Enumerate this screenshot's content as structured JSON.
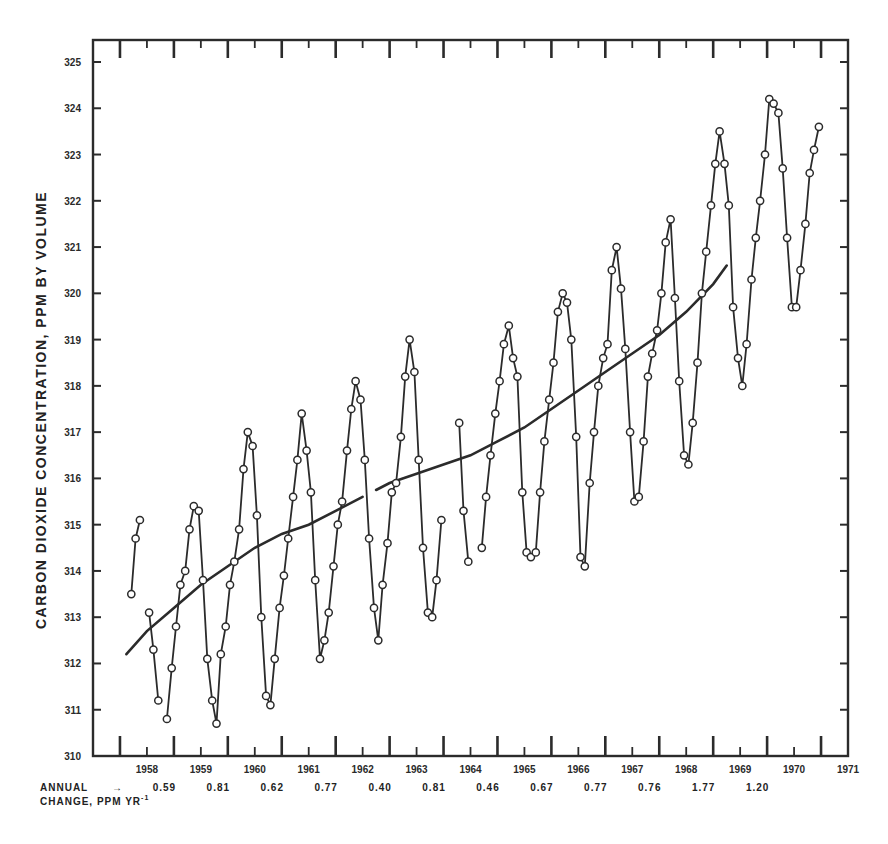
{
  "chart_data": {
    "type": "line",
    "title": "",
    "xlabel": "",
    "ylabel": "CARBON DIOXIDE CONCENTRATION, PPM BY VOLUME",
    "ylim": [
      310,
      325
    ],
    "xlim": [
      1957.5,
      1971.5
    ],
    "y_ticks": [
      "310",
      "311",
      "312",
      "313",
      "314",
      "315",
      "316",
      "317",
      "318",
      "319",
      "320",
      "321",
      "322",
      "323",
      "324",
      "325"
    ],
    "x_tick_labels": [
      "1958",
      "1959",
      "1960",
      "1961",
      "1962",
      "1963",
      "1964",
      "1965",
      "1966",
      "1967",
      "1968",
      "1969",
      "1970",
      "1971"
    ],
    "grid": false,
    "annual_change": {
      "label_line1": "ANNUAL",
      "label_line2": "CHANGE, PPM YR",
      "label_superscript": "-1",
      "arrow": "→",
      "values": [
        "0.59",
        "0.81",
        "0.62",
        "0.77",
        "0.40",
        "0.81",
        "0.46",
        "0.67",
        "0.77",
        "0.76",
        "1.77",
        "1.20"
      ]
    },
    "series": [
      {
        "name": "monthly-mean-co2",
        "marker": "open-circle",
        "segments": [
          [
            [
              1958.21,
              313.5
            ],
            [
              1958.29,
              314.7
            ],
            [
              1958.37,
              315.1
            ]
          ],
          [
            [
              1958.54,
              313.1
            ],
            [
              1958.62,
              312.3
            ],
            [
              1958.71,
              311.2
            ]
          ],
          [
            [
              1958.87,
              310.8
            ],
            [
              1958.96,
              311.9
            ],
            [
              1959.04,
              312.8
            ],
            [
              1959.12,
              313.7
            ],
            [
              1959.21,
              314.0
            ],
            [
              1959.29,
              314.9
            ],
            [
              1959.37,
              315.4
            ],
            [
              1959.46,
              315.3
            ],
            [
              1959.54,
              313.8
            ],
            [
              1959.62,
              312.1
            ],
            [
              1959.71,
              311.2
            ],
            [
              1959.79,
              310.7
            ],
            [
              1959.87,
              312.2
            ],
            [
              1959.96,
              312.8
            ],
            [
              1960.04,
              313.7
            ],
            [
              1960.12,
              314.2
            ],
            [
              1960.21,
              314.9
            ],
            [
              1960.29,
              316.2
            ],
            [
              1960.37,
              317.0
            ],
            [
              1960.46,
              316.7
            ],
            [
              1960.54,
              315.2
            ],
            [
              1960.62,
              313.0
            ],
            [
              1960.71,
              311.3
            ],
            [
              1960.79,
              311.1
            ],
            [
              1960.87,
              312.1
            ],
            [
              1960.96,
              313.2
            ],
            [
              1961.04,
              313.9
            ],
            [
              1961.12,
              314.7
            ],
            [
              1961.21,
              315.6
            ],
            [
              1961.29,
              316.4
            ],
            [
              1961.37,
              317.4
            ],
            [
              1961.46,
              316.6
            ],
            [
              1961.54,
              315.7
            ],
            [
              1961.62,
              313.8
            ],
            [
              1961.71,
              312.1
            ],
            [
              1961.79,
              312.5
            ],
            [
              1961.87,
              313.1
            ],
            [
              1961.96,
              314.1
            ],
            [
              1962.04,
              315.0
            ],
            [
              1962.12,
              315.5
            ],
            [
              1962.21,
              316.6
            ],
            [
              1962.29,
              317.5
            ],
            [
              1962.37,
              318.1
            ],
            [
              1962.46,
              317.7
            ],
            [
              1962.54,
              316.4
            ],
            [
              1962.62,
              314.7
            ],
            [
              1962.71,
              313.2
            ],
            [
              1962.79,
              312.5
            ],
            [
              1962.87,
              313.7
            ],
            [
              1962.96,
              314.6
            ],
            [
              1963.04,
              315.7
            ],
            [
              1963.12,
              315.9
            ],
            [
              1963.21,
              316.9
            ],
            [
              1963.29,
              318.2
            ],
            [
              1963.37,
              319.0
            ],
            [
              1963.46,
              318.3
            ],
            [
              1963.54,
              316.4
            ],
            [
              1963.62,
              314.5
            ],
            [
              1963.71,
              313.1
            ],
            [
              1963.79,
              313.0
            ],
            [
              1963.87,
              313.8
            ],
            [
              1963.96,
              315.1
            ]
          ],
          [
            [
              1964.29,
              317.2
            ],
            [
              1964.37,
              315.3
            ],
            [
              1964.46,
              314.2
            ]
          ],
          [
            [
              1964.71,
              314.5
            ],
            [
              1964.79,
              315.6
            ],
            [
              1964.87,
              316.5
            ],
            [
              1964.96,
              317.4
            ],
            [
              1965.04,
              318.1
            ],
            [
              1965.12,
              318.9
            ],
            [
              1965.21,
              319.3
            ],
            [
              1965.29,
              318.6
            ],
            [
              1965.37,
              318.2
            ],
            [
              1965.46,
              315.7
            ],
            [
              1965.54,
              314.4
            ],
            [
              1965.62,
              314.3
            ],
            [
              1965.71,
              314.4
            ],
            [
              1965.79,
              315.7
            ],
            [
              1965.87,
              316.8
            ],
            [
              1965.96,
              317.7
            ],
            [
              1966.04,
              318.5
            ],
            [
              1966.12,
              319.6
            ],
            [
              1966.21,
              320.0
            ],
            [
              1966.29,
              319.8
            ],
            [
              1966.37,
              319.0
            ],
            [
              1966.46,
              316.9
            ],
            [
              1966.54,
              314.3
            ],
            [
              1966.62,
              314.1
            ],
            [
              1966.71,
              315.9
            ],
            [
              1966.79,
              317.0
            ],
            [
              1966.87,
              318.0
            ],
            [
              1966.96,
              318.6
            ],
            [
              1967.04,
              318.9
            ],
            [
              1967.12,
              320.5
            ],
            [
              1967.21,
              321.0
            ],
            [
              1967.29,
              320.1
            ],
            [
              1967.37,
              318.8
            ],
            [
              1967.46,
              317.0
            ],
            [
              1967.54,
              315.5
            ],
            [
              1967.62,
              315.6
            ],
            [
              1967.71,
              316.8
            ],
            [
              1967.79,
              318.2
            ],
            [
              1967.87,
              318.7
            ],
            [
              1967.96,
              319.2
            ],
            [
              1968.04,
              320.0
            ],
            [
              1968.12,
              321.1
            ],
            [
              1968.21,
              321.6
            ],
            [
              1968.29,
              319.9
            ],
            [
              1968.37,
              318.1
            ],
            [
              1968.46,
              316.5
            ],
            [
              1968.54,
              316.3
            ],
            [
              1968.62,
              317.2
            ],
            [
              1968.71,
              318.5
            ],
            [
              1968.79,
              320.0
            ],
            [
              1968.87,
              320.9
            ],
            [
              1968.96,
              321.9
            ],
            [
              1969.04,
              322.8
            ],
            [
              1969.12,
              323.5
            ],
            [
              1969.21,
              322.8
            ],
            [
              1969.29,
              321.9
            ],
            [
              1969.37,
              319.7
            ],
            [
              1969.46,
              318.6
            ],
            [
              1969.54,
              318.0
            ],
            [
              1969.62,
              318.9
            ],
            [
              1969.71,
              320.3
            ],
            [
              1969.79,
              321.2
            ],
            [
              1969.87,
              322.0
            ],
            [
              1969.96,
              323.0
            ],
            [
              1970.04,
              324.2
            ],
            [
              1970.12,
              324.1
            ],
            [
              1970.21,
              323.9
            ],
            [
              1970.29,
              322.7
            ],
            [
              1970.37,
              321.2
            ],
            [
              1970.46,
              319.7
            ],
            [
              1970.54,
              319.7
            ],
            [
              1970.62,
              320.5
            ],
            [
              1970.71,
              321.5
            ],
            [
              1970.79,
              322.6
            ],
            [
              1970.87,
              323.1
            ],
            [
              1970.96,
              323.6
            ]
          ]
        ]
      },
      {
        "name": "trend-curve",
        "marker": "none",
        "segments": [
          [
            [
              1958.12,
              312.2
            ],
            [
              1958.5,
              312.7
            ],
            [
              1959.0,
              313.2
            ],
            [
              1959.5,
              313.7
            ],
            [
              1960.0,
              314.1
            ],
            [
              1960.5,
              314.5
            ],
            [
              1961.0,
              314.8
            ],
            [
              1961.5,
              315.0
            ],
            [
              1962.0,
              315.3
            ],
            [
              1962.5,
              315.6
            ]
          ],
          [
            [
              1962.75,
              315.75
            ],
            [
              1963.0,
              315.9
            ],
            [
              1963.5,
              316.1
            ],
            [
              1964.0,
              316.3
            ],
            [
              1964.5,
              316.5
            ],
            [
              1965.0,
              316.8
            ],
            [
              1965.5,
              317.1
            ],
            [
              1966.0,
              317.5
            ],
            [
              1966.5,
              317.9
            ],
            [
              1967.0,
              318.3
            ],
            [
              1967.5,
              318.7
            ],
            [
              1968.0,
              319.1
            ],
            [
              1968.5,
              319.6
            ],
            [
              1969.0,
              320.2
            ],
            [
              1969.25,
              320.6
            ]
          ]
        ]
      }
    ]
  }
}
